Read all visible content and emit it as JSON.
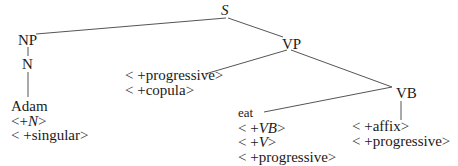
{
  "diagram": {
    "type": "syntactic-tree",
    "nodes": {
      "S": {
        "label": "S",
        "italic": true
      },
      "NP": {
        "label": "NP"
      },
      "VP": {
        "label": "VP"
      },
      "N": {
        "label": "N"
      },
      "VB": {
        "label": "VB"
      }
    },
    "leaves": {
      "adam": {
        "word": "Adam",
        "features": [
          {
            "open": "<",
            "sign": "+",
            "value": "N",
            "italic": true,
            "close": ">"
          },
          {
            "open": "<",
            "sign": "+",
            "value": "singular",
            "italic": false,
            "close": ">"
          }
        ]
      },
      "vp_features": {
        "features": [
          {
            "open": "<",
            "sign": "+",
            "value": "progressive",
            "italic": false,
            "close": ">"
          },
          {
            "open": "<",
            "sign": "+",
            "value": "copula",
            "italic": false,
            "close": ">"
          }
        ]
      },
      "eat": {
        "word": "eat",
        "features": [
          {
            "open": "<",
            "sign": "+",
            "value": "VB",
            "italic": true,
            "close": ">"
          },
          {
            "open": "<",
            "sign": "+",
            "value": "V",
            "italic": true,
            "close": ">"
          },
          {
            "open": "<",
            "sign": "+",
            "value": "progressive",
            "italic": false,
            "close": ">"
          }
        ]
      },
      "vb_features": {
        "features": [
          {
            "open": "<",
            "sign": "+",
            "value": "affix",
            "italic": false,
            "close": ">"
          },
          {
            "open": "<",
            "sign": "+",
            "value": "progressive",
            "italic": false,
            "close": ">"
          }
        ]
      }
    },
    "edges": [
      [
        "S",
        "NP"
      ],
      [
        "S",
        "VP"
      ],
      [
        "NP",
        "N"
      ],
      [
        "N",
        "Adam"
      ],
      [
        "VP",
        "vp_features"
      ],
      [
        "VP",
        "VB"
      ],
      [
        "VB",
        "eat"
      ],
      [
        "VB",
        "vb_features"
      ]
    ],
    "colors": {
      "line": "#555555",
      "text": "#1a1a1a",
      "background": "#ffffff"
    }
  }
}
